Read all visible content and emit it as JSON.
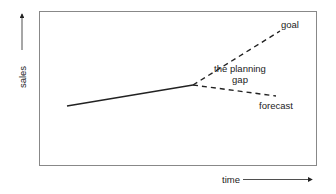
{
  "diagram": {
    "axes": {
      "y_label": "sales",
      "x_label": "time"
    },
    "lines": {
      "history": {
        "style": "solid",
        "from": [
          67,
          106
        ],
        "to": [
          193,
          85
        ]
      },
      "goal": {
        "style": "dashed",
        "from": [
          193,
          85
        ],
        "to": [
          280,
          30
        ]
      },
      "forecast": {
        "style": "dashed",
        "from": [
          193,
          85
        ],
        "to": [
          276,
          96
        ]
      }
    },
    "labels": {
      "goal": "goal",
      "gap_line1": "the planning",
      "gap_line2": "gap",
      "forecast": "forecast"
    },
    "colors": {
      "frame": "#888888",
      "line": "#222222",
      "text": "#222222"
    }
  }
}
